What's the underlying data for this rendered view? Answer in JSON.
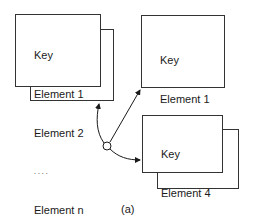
{
  "diagram": {
    "node_left": {
      "lines": [
        "Key",
        "Element 1",
        "Element 2",
        ". . . .",
        "Element n"
      ]
    },
    "node_top_right": {
      "lines": [
        "Key",
        "Element 1",
        "Element 2",
        "Element 3"
      ]
    },
    "node_bottom_right": {
      "lines": [
        "Key",
        "Element 4",
        ". . . .",
        "Element n"
      ]
    },
    "caption": "(a)"
  }
}
